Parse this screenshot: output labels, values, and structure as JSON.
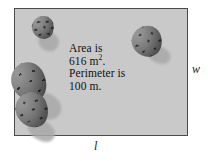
{
  "figure": {
    "name": "rectangular-field-diagram",
    "field": {
      "fill_color": "#c9c9c9",
      "border_color": "#4a4a4a"
    },
    "annotation": {
      "line1": "Area is",
      "line2_value": "616 m",
      "line2_exponent": "2",
      "line2_suffix": ".",
      "line3": "Perimeter is",
      "line4": "100 m."
    },
    "labels": {
      "width": "w",
      "length": "l"
    },
    "decorations": [
      {
        "name": "pine-cone-top-left"
      },
      {
        "name": "pine-cone-top-right"
      },
      {
        "name": "pine-cone-bottom-left"
      }
    ]
  }
}
